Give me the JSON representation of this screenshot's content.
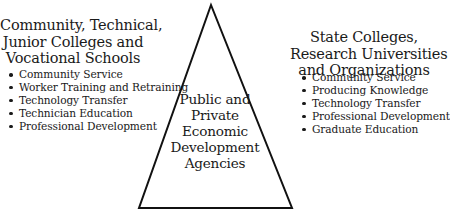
{
  "diagram": {
    "type": "triangle-relationship",
    "center": {
      "lines": [
        "Public and",
        "Private",
        "Economic",
        "Development",
        "Agencies"
      ]
    },
    "left_group": {
      "heading_lines": [
        "Community, Technical,",
        "Junior Colleges and",
        "Vocational Schools"
      ],
      "items": [
        "Community Service",
        "Worker Training and Retraining",
        "Technology Transfer",
        "Technician Education",
        "Professional Development"
      ]
    },
    "right_group": {
      "heading_lines": [
        "State Colleges,",
        "Research Universities",
        "and Organizations"
      ],
      "items": [
        "Community Service",
        "Producing Knowledge",
        "Technology Transfer",
        "Professional Development",
        "Graduate Education"
      ]
    },
    "colors": {
      "line": "#111111",
      "text": "#1a1a1a",
      "background": "#ffffff"
    }
  }
}
